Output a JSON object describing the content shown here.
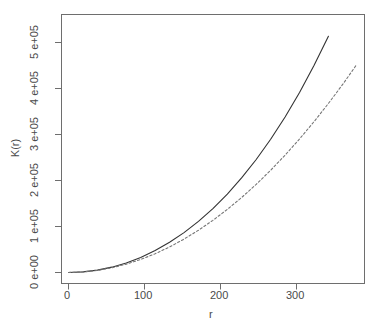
{
  "chart_data": {
    "type": "line",
    "title": "",
    "xlabel": "r",
    "ylabel": "K(r)",
    "xlim": [
      0,
      379
    ],
    "ylim": [
      0,
      543478
    ],
    "grid": false,
    "legend": "none",
    "xticks": [
      0,
      100,
      200,
      300
    ],
    "xticklabels": [
      "0",
      "100",
      "200",
      "300"
    ],
    "yticks": [
      0,
      100000,
      200000,
      300000,
      400000,
      500000
    ],
    "yticklabels": [
      "0 e+00",
      "1 e+05",
      "2 e+05",
      "3 e+05",
      "4 e+05",
      "5 e+05"
    ],
    "series": [
      {
        "name": "K-empirical",
        "style": "solid",
        "color": "#333333",
        "x": [
          0,
          19,
          38,
          57,
          76,
          95,
          114,
          133,
          152,
          171,
          190,
          209,
          228,
          247,
          266,
          285,
          304,
          323,
          342,
          361,
          379
        ],
        "y": [
          0,
          1300,
          5100,
          11600,
          20800,
          32800,
          47700,
          65600,
          86700,
          111100,
          139000,
          170600,
          206100,
          245700,
          289600,
          338100,
          391400,
          449800,
          513600,
          583100,
          658900
        ]
      },
      {
        "name": "K-theoretical-poisson",
        "style": "dashed",
        "color": "#777777",
        "x": [
          0,
          19,
          38,
          57,
          76,
          95,
          114,
          133,
          152,
          171,
          190,
          209,
          228,
          247,
          266,
          285,
          304,
          323,
          342,
          361,
          379
        ],
        "y": [
          0,
          1134,
          4536,
          10207,
          18146,
          28353,
          40828,
          55572,
          72583,
          91863,
          113411,
          137228,
          163313,
          191666,
          222288,
          255178,
          290336,
          327763,
          367458,
          409422,
          451654
        ]
      }
    ],
    "annotations": []
  },
  "axis": {
    "x_label": "r",
    "y_label": "K(r)"
  }
}
